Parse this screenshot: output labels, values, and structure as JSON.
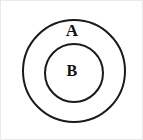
{
  "figure": {
    "type": "euler-diagram",
    "background_color": "#ffffff",
    "border_color": "#e9e9e9",
    "stroke_color": "#1a1a1a"
  },
  "chart_data": {
    "type": "diagram",
    "title": "",
    "sets": [
      {
        "label": "A",
        "role": "outer-set",
        "shape": "circle",
        "center_x": 73,
        "center_y": 70,
        "radius": 51,
        "stroke_width": 2,
        "stroke_color": "#1a1a1a",
        "fill": "#ffffff",
        "label_x": 71,
        "label_y": 29
      },
      {
        "label": "B",
        "role": "inner-set",
        "shape": "circle",
        "center_x": 73,
        "center_y": 72,
        "radius": 29,
        "stroke_width": 2,
        "stroke_color": "#1a1a1a",
        "fill": "#ffffff",
        "label_x": 71,
        "label_y": 70
      }
    ],
    "relation": "B is a proper subset of A",
    "legend": [],
    "annotations": []
  },
  "labels": {
    "outer": "A",
    "inner": "B"
  }
}
